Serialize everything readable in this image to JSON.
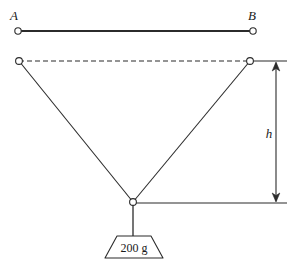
{
  "figure": {
    "stroke_color": "#2b2b2b",
    "background_color": "#ffffff",
    "labels": {
      "anchor_left": "A",
      "anchor_right": "B",
      "height_dimension": "h",
      "mass": "200 g"
    },
    "nodes": [
      {
        "name": "anchor-a",
        "x": 18,
        "y": 31,
        "r": 3.2
      },
      {
        "name": "anchor-b",
        "x": 253,
        "y": 31,
        "r": 3.2
      },
      {
        "name": "string-left-top",
        "x": 19,
        "y": 61,
        "r": 3.4
      },
      {
        "name": "string-right-top",
        "x": 250,
        "y": 61,
        "r": 3.4
      },
      {
        "name": "junction",
        "x": 133,
        "y": 202,
        "r": 3.4
      }
    ],
    "segments": {
      "rod_ab": {
        "x1": 18,
        "y1": 31,
        "x2": 253,
        "y2": 31,
        "style": "solid",
        "width": 2
      },
      "dashed_span": {
        "x1": 19,
        "y1": 61,
        "x2": 250,
        "y2": 61,
        "style": "dashed",
        "width": 1.1
      },
      "string_left": {
        "x1": 19,
        "y1": 61,
        "x2": 133,
        "y2": 202,
        "style": "solid",
        "width": 1.1
      },
      "string_right": {
        "x1": 250,
        "y1": 61,
        "x2": 133,
        "y2": 202,
        "style": "solid",
        "width": 1.1
      },
      "hanger": {
        "x1": 133,
        "y1": 202,
        "x2": 133,
        "y2": 236,
        "style": "solid",
        "width": 1.1
      },
      "ref_line_top": {
        "x1": 250,
        "y1": 61,
        "x2": 287,
        "y2": 61,
        "style": "solid",
        "width": 1.1
      },
      "ref_line_bottom": {
        "x1": 135,
        "y1": 203,
        "x2": 287,
        "y2": 203,
        "style": "solid",
        "width": 1.1
      },
      "dimension_arrow": {
        "x": 276,
        "y1": 62,
        "y2": 202,
        "style": "double-arrow",
        "width": 1.1
      }
    },
    "weight_block": {
      "top_left_x": 117,
      "top_right_x": 151,
      "bottom_left_x": 105,
      "bottom_right_x": 163,
      "top_y": 236,
      "bottom_y": 258,
      "label_x": 134,
      "label_y": 252
    },
    "label_positions": {
      "anchor_left": {
        "x": 14,
        "y": 20
      },
      "anchor_right": {
        "x": 250,
        "y": 20
      },
      "height_dimension": {
        "x": 270,
        "y": 138
      }
    }
  }
}
